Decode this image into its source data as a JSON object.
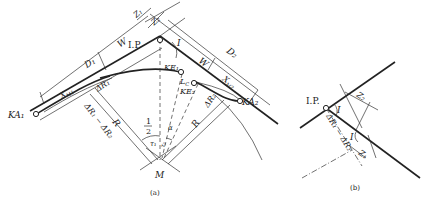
{
  "figure_a": {
    "caption": "(a)",
    "labels": {
      "ip": "I.P.",
      "angle_i": "I",
      "z1": "Z₁",
      "z2": "Z₂",
      "d1": "D₁",
      "d2": "D₂",
      "w_left": "W",
      "w_right": "W",
      "xm1": "X",
      "xm1_sub": "M1",
      "xm2": "X",
      "xm2_sub": "M2",
      "ka1": "KA₁",
      "ka2": "KA₂",
      "ke1": "KE₁",
      "ke2": "KE₂",
      "lc": "L",
      "lc_sub": "C",
      "dr1": "ΔR₁",
      "dr2": "ΔR₂",
      "dr_diff": "ΔR₁ − ΔR₂",
      "r_left": "R",
      "r_right": "R",
      "half_num": "1",
      "half_den": "2",
      "tau1": "τ₁",
      "tau2": "τ₂",
      "alpha": "α",
      "center": "M"
    }
  },
  "figure_b": {
    "caption": "(b)",
    "labels": {
      "ip": "I.P.",
      "angle_i_top": "I",
      "angle_i_bottom": "I",
      "z2": "Z₂",
      "z1": "Z₁",
      "dr_diff": "ΔR₁ − ΔR₂"
    }
  }
}
